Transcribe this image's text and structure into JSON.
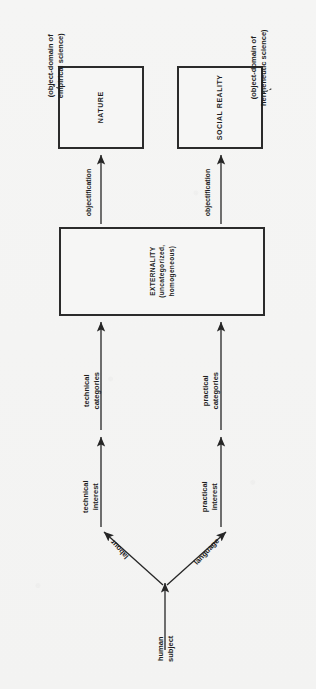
{
  "diagram": {
    "orientation": "rotated-90-counterclockwise",
    "background_color": "#f4f4f3",
    "ink_color": "#1d1d1d",
    "boxes": [
      {
        "id": "nature",
        "label": "NATURE",
        "x": 58,
        "y": 66,
        "w": 86,
        "h": 83
      },
      {
        "id": "social",
        "label": "SOCIAL REALITY",
        "x": 177,
        "y": 66,
        "w": 86,
        "h": 83
      },
      {
        "id": "externality",
        "label_line1": "EXTERNALITY",
        "label_line2": "(uncategorized,",
        "label_line3": "homogeneous)",
        "x": 59,
        "y": 227,
        "w": 206,
        "h": 89
      }
    ],
    "annotations": [
      {
        "id": "empirical",
        "line1": "(object-domain of",
        "line2": "empirical science)"
      },
      {
        "id": "hermeneutic",
        "line1": "(object-domain of",
        "line2": "hermeneutic science)"
      }
    ],
    "arrow_labels": {
      "objectification_left": "objectification",
      "objectification_right": "objectification",
      "technical_categories_line1": "technical",
      "technical_categories_line2": "categories",
      "practical_categories_line1": "practical",
      "practical_categories_line2": "categories",
      "technical_interest_line1": "technical",
      "technical_interest_line2": "interest",
      "practical_interest_line1": "practical",
      "practical_interest_line2": "interest",
      "labour": "labour",
      "language": "language",
      "human_subject_line1": "human",
      "human_subject_line2": "subject"
    }
  }
}
